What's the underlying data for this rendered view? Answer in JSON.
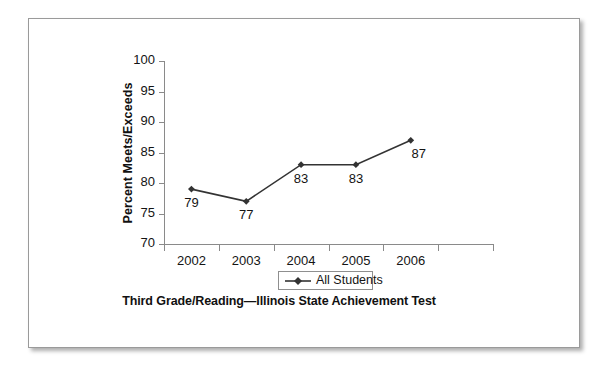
{
  "figure": {
    "caption": "Third Grade/Reading—Illinois State Achievement Test",
    "frame_color": "#9a9a9a",
    "background": "#ffffff"
  },
  "chart_data": {
    "type": "line",
    "title": "",
    "subtitle": "",
    "categories": [
      "2002",
      "2003",
      "2004",
      "2005",
      "2006"
    ],
    "series": [
      {
        "name": "All Students",
        "values": [
          79,
          77,
          83,
          83,
          87
        ],
        "marker": "diamond",
        "color": "#333333",
        "show_data_labels": true
      }
    ],
    "values": [
      79,
      77,
      83,
      83,
      87
    ],
    "data_labels": [
      "79",
      "77",
      "83",
      "83",
      "87"
    ],
    "xlabel": "",
    "ylabel": "Percent Meets/Exceeds",
    "ylim": [
      70,
      100
    ],
    "ytick_step": 5,
    "yticks": [
      100,
      95,
      90,
      85,
      80,
      75,
      70
    ],
    "ytick_labels": [
      "100",
      "95",
      "90",
      "85",
      "80",
      "75",
      "70"
    ],
    "grid": false,
    "legend_position": "bottom",
    "legend_entries": [
      "All Students"
    ],
    "annotations": []
  }
}
